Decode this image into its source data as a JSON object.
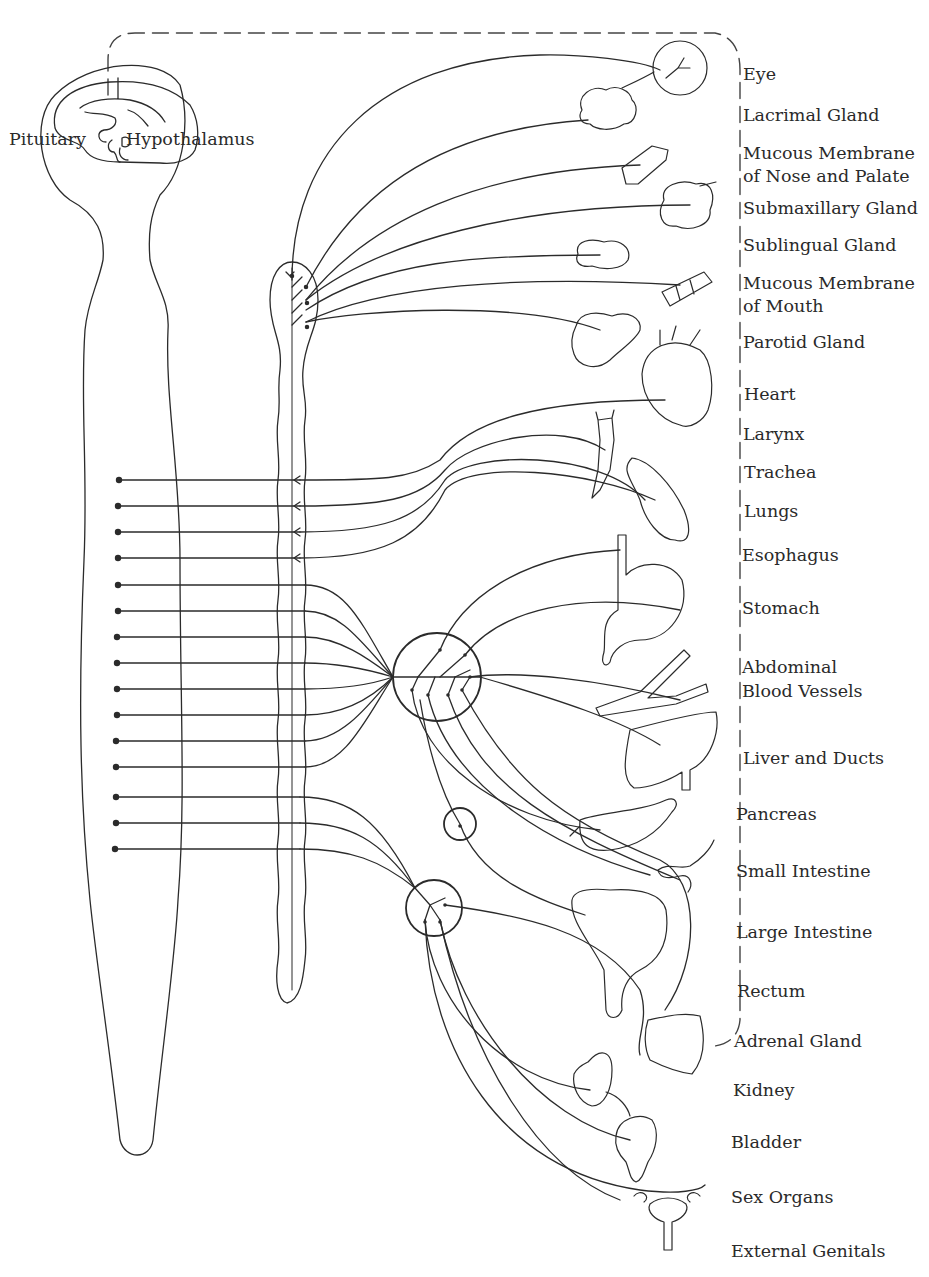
{
  "diagram": {
    "stroke_color": "#2b2b2b",
    "background": "#ffffff",
    "brain_labels": {
      "pituitary": "Pituitary",
      "hypothalamus": "Hypothalamus"
    },
    "organ_labels": [
      {
        "id": "eye",
        "lines": [
          "Eye"
        ],
        "x": 743,
        "y": 63
      },
      {
        "id": "lacrimal-gland",
        "lines": [
          "Lacrimal Gland"
        ],
        "x": 743,
        "y": 104
      },
      {
        "id": "mucous-membrane-nose-palate",
        "lines": [
          "Mucous Membrane",
          "of Nose and Palate"
        ],
        "x": 743,
        "y": 142
      },
      {
        "id": "submaxillary-gland",
        "lines": [
          "Submaxillary Gland"
        ],
        "x": 743,
        "y": 197
      },
      {
        "id": "sublingual-gland",
        "lines": [
          "Sublingual Gland"
        ],
        "x": 743,
        "y": 234
      },
      {
        "id": "mucous-membrane-mouth",
        "lines": [
          "Mucous Membrane",
          "of Mouth"
        ],
        "x": 743,
        "y": 272
      },
      {
        "id": "parotid-gland",
        "lines": [
          "Parotid Gland"
        ],
        "x": 743,
        "y": 331
      },
      {
        "id": "heart",
        "lines": [
          "Heart"
        ],
        "x": 743,
        "y": 383
      },
      {
        "id": "larynx",
        "lines": [
          "Larynx"
        ],
        "x": 743,
        "y": 423
      },
      {
        "id": "trachea",
        "lines": [
          "Trachea"
        ],
        "x": 743,
        "y": 461
      },
      {
        "id": "lungs",
        "lines": [
          "Lungs"
        ],
        "x": 743,
        "y": 500
      },
      {
        "id": "esophagus",
        "lines": [
          "Esophagus"
        ],
        "x": 742,
        "y": 544
      },
      {
        "id": "stomach",
        "lines": [
          "Stomach"
        ],
        "x": 742,
        "y": 597
      },
      {
        "id": "abdominal-blood-vessels",
        "lines": [
          "Abdominal",
          "Blood Vessels"
        ],
        "x": 742,
        "y": 656
      },
      {
        "id": "liver-and-ducts",
        "lines": [
          "Liver and Ducts"
        ],
        "x": 743,
        "y": 747
      },
      {
        "id": "pancreas",
        "lines": [
          "Pancreas"
        ],
        "x": 736,
        "y": 803
      },
      {
        "id": "small-intestine",
        "lines": [
          "Small Intestine"
        ],
        "x": 736,
        "y": 860
      },
      {
        "id": "large-intestine",
        "lines": [
          "Large Intestine"
        ],
        "x": 736,
        "y": 921
      },
      {
        "id": "rectum",
        "lines": [
          "Rectum"
        ],
        "x": 737,
        "y": 980
      },
      {
        "id": "adrenal-gland",
        "lines": [
          "Adrenal Gland"
        ],
        "x": 734,
        "y": 1030
      },
      {
        "id": "kidney",
        "lines": [
          "Kidney"
        ],
        "x": 733,
        "y": 1079
      },
      {
        "id": "bladder",
        "lines": [
          "Bladder"
        ],
        "x": 731,
        "y": 1131
      },
      {
        "id": "sex-organs",
        "lines": [
          "Sex Organs"
        ],
        "x": 731,
        "y": 1186
      },
      {
        "id": "external-genitals",
        "lines": [
          "External Genitals"
        ],
        "x": 731,
        "y": 1240
      }
    ],
    "spinal_dot_rows_y": [
      480,
      506,
      532,
      558,
      585,
      611,
      637,
      663,
      689,
      715,
      741,
      767,
      797,
      823,
      849
    ],
    "ganglia": [
      {
        "id": "cervical-chain-ganglion",
        "cx": 292,
        "cy": 300
      },
      {
        "id": "celiac-ganglion",
        "cx": 437,
        "cy": 677,
        "r": 44
      },
      {
        "id": "adrenal-ganglion",
        "cx": 460,
        "cy": 824,
        "r": 16
      },
      {
        "id": "inferior-mesenteric-ganglion",
        "cx": 434,
        "cy": 908,
        "r": 28
      }
    ]
  }
}
